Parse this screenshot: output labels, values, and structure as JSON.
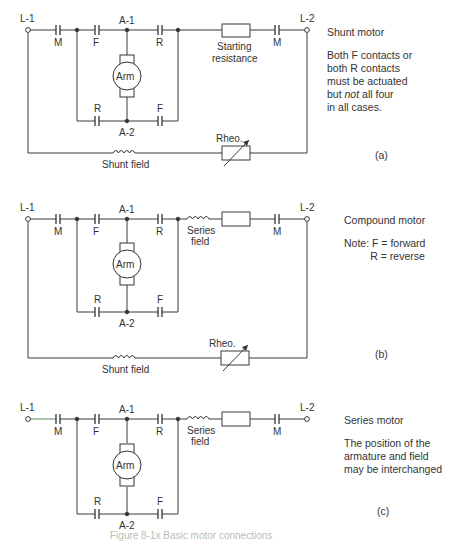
{
  "figure": {
    "caption": "Figure 8-1x  Basic motor connections"
  },
  "panels": [
    {
      "id": "a",
      "tag": "(a)",
      "title": "Shunt motor",
      "note_lines": [
        "Both F contacts or",
        "both R contacts",
        "must be actuated",
        "but not all four",
        "in all cases."
      ],
      "note_italic_word": "not",
      "labels": {
        "l1": "L-1",
        "l2": "L-2",
        "m_left": "M",
        "m_right": "M",
        "f_top": "F",
        "r_top": "R",
        "r_bottom": "R",
        "f_bottom": "F",
        "a1": "A-1",
        "a2": "A-2",
        "arm": "Arm",
        "series_element": "Starting resistance",
        "shunt_field": "Shunt field",
        "rheo": "Rheo."
      }
    },
    {
      "id": "b",
      "tag": "(b)",
      "title": "Compound motor",
      "note_lines": [
        "Note: F = forward",
        "         R = reverse"
      ],
      "labels": {
        "l1": "L-1",
        "l2": "L-2",
        "m_left": "M",
        "m_right": "M",
        "f_top": "F",
        "r_top": "R",
        "r_bottom": "R",
        "f_bottom": "F",
        "a1": "A-1",
        "a2": "A-2",
        "arm": "Arm",
        "series_field_1": "Series",
        "series_field_2": "field",
        "shunt_field": "Shunt field",
        "rheo": "Rheo."
      }
    },
    {
      "id": "c",
      "tag": "(c)",
      "title": "Series motor",
      "note_lines": [
        "The position of the",
        "armature and field",
        "may be interchanged"
      ],
      "labels": {
        "l1": "L-1",
        "l2": "L-2",
        "m_left": "M",
        "m_right": "M",
        "f_top": "F",
        "r_top": "R",
        "r_bottom": "R",
        "f_bottom": "F",
        "a1": "A-1",
        "a2": "A-2",
        "arm": "Arm",
        "series_field_1": "Series",
        "series_field_2": "field"
      }
    }
  ],
  "colors": {
    "line": "#3a3a3a",
    "text": "#333333",
    "background": "#ffffff"
  }
}
